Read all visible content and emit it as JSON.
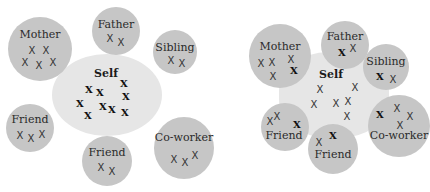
{
  "colors": {
    "outer_circle": "#c6c6c6",
    "self_region": "#e6e6e6",
    "text": "#2a2a2a"
  },
  "diagrams": [
    {
      "name": "left-diagram",
      "self": {
        "label": "Self"
      },
      "circles": [
        {
          "label": "Mother"
        },
        {
          "label": "Father"
        },
        {
          "label": "Sibling"
        },
        {
          "label": "Friend"
        },
        {
          "label": "Friend"
        },
        {
          "label": "Co-worker"
        }
      ]
    },
    {
      "name": "right-diagram",
      "self": {
        "label": "Self"
      },
      "circles": [
        {
          "label": "Mother"
        },
        {
          "label": "Father"
        },
        {
          "label": "Sibling"
        },
        {
          "label": "Friend"
        },
        {
          "label": "Friend"
        },
        {
          "label": "Co-worker"
        }
      ]
    }
  ],
  "marker": "X"
}
